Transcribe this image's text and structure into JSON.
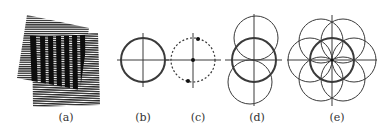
{
  "figure": {
    "panels": [
      {
        "id": "a",
        "label": "(a)",
        "description": "two overlapping striped gratings producing moire fringes",
        "label_x": 66
      },
      {
        "id": "b",
        "label": "(b)",
        "description": "single circle with crosshair",
        "label_x": 143
      },
      {
        "id": "c",
        "label": "(c)",
        "description": "dashed circle with crosshair and three dots",
        "label_x": 198
      },
      {
        "id": "d",
        "label": "(d)",
        "description": "three vertically stacked circles with crosshair",
        "label_x": 257
      },
      {
        "id": "e",
        "label": "(e)",
        "description": "central circle surrounded by six circles (flower pattern) with crosshair",
        "label_x": 337
      }
    ],
    "colors": {
      "stroke": "#3a3a3a",
      "stroke_light": "#555555",
      "background": "#ffffff"
    }
  }
}
